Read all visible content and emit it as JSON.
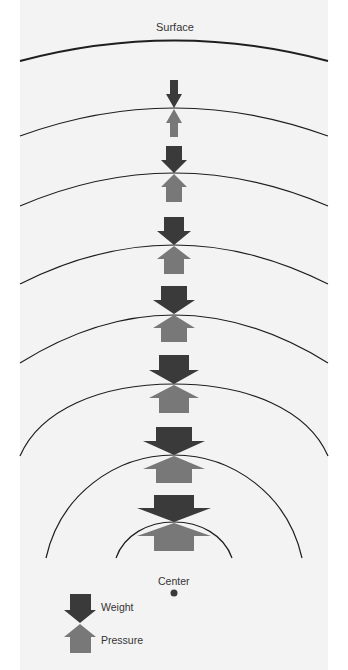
{
  "diagram": {
    "title_label": "Surface",
    "center_label": "Center",
    "colors": {
      "background": "#f3f3f3",
      "weight_arrow": "#3a3a3a",
      "pressure_arrow": "#787878",
      "layer_line": "#1e1e1e",
      "center_dot": "#3a3a3a"
    },
    "layers_count": 7,
    "arrow_pairs": [
      {
        "layer": 1,
        "relative_size": 1
      },
      {
        "layer": 2,
        "relative_size": 2
      },
      {
        "layer": 3,
        "relative_size": 3
      },
      {
        "layer": 4,
        "relative_size": 4
      },
      {
        "layer": 5,
        "relative_size": 5
      },
      {
        "layer": 6,
        "relative_size": 6
      },
      {
        "layer": 7,
        "relative_size": 7
      }
    ]
  },
  "legend": {
    "weight_label": "Weight",
    "pressure_label": "Pressure"
  }
}
